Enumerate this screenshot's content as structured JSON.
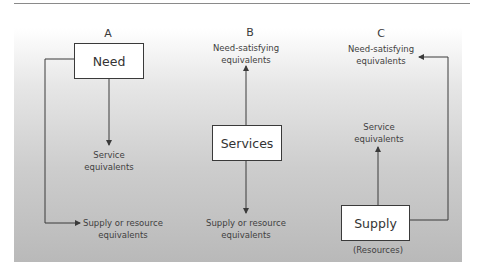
{
  "diagram": {
    "columns": [
      {
        "letter": "A",
        "box_label": "Need",
        "down_label_line1": "Service",
        "down_label_line2": "equivalents",
        "side_label_line1": "Supply or resource",
        "side_label_line2": "equivalents"
      },
      {
        "letter": "B",
        "up_label_line1": "Need-satisfying",
        "up_label_line2": "equivalents",
        "box_label": "Services",
        "down_label_line1": "Supply or resource",
        "down_label_line2": "equivalents"
      },
      {
        "letter": "C",
        "top_label_line1": "Need-satisfying",
        "top_label_line2": "equivalents",
        "mid_label_line1": "Service",
        "mid_label_line2": "equivalents",
        "box_label": "Supply",
        "box_caption": "(Resources)"
      }
    ],
    "colors": {
      "line": "#3a3a3a",
      "panel_top": "#ffffff",
      "panel_bottom": "#b9b9b9",
      "box_fill": "#ffffff"
    }
  }
}
